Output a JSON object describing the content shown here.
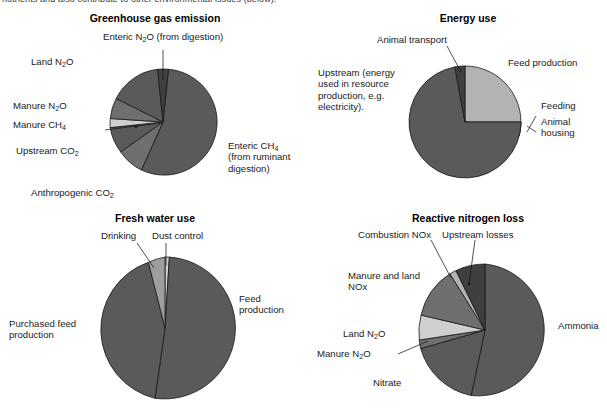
{
  "page": {
    "cropped_caption": "nutrients and also contribute to other environmental issues (below)."
  },
  "colors": {
    "dark_main": "#5a5a5a",
    "dark_deep": "#3f3f3f",
    "mid": "#6f6f6f",
    "light": "#b3b3b3",
    "pale": "#cfcfcf",
    "outline": "#15181a",
    "text": "#1a1a1a",
    "background": "#ffffff"
  },
  "charts": [
    {
      "id": "greenhouse-gas-emission",
      "title": "Greenhouse gas emission",
      "labels": [
        "Enteric N₂O (from digestion)",
        "Land N₂O",
        "Manure N₂O",
        "Manure CH₄",
        "Upstream CO₂",
        "Anthropogenic CO₂",
        "Enteric CH₄ (from ruminant digestion)"
      ]
    },
    {
      "id": "energy-use",
      "title": "Energy use",
      "labels": [
        "Animal transport",
        "Feed production",
        "Feeding",
        "Animal housing",
        "Upstream (energy used in resource production, e.g. electricity)."
      ]
    },
    {
      "id": "fresh-water-use",
      "title": "Fresh water use",
      "labels": [
        "Drinking",
        "Dust control",
        "Feed production",
        "Purchased feed production"
      ]
    },
    {
      "id": "reactive-nitrogen-loss",
      "title": "Reactive nitrogen loss",
      "labels": [
        "Combustion NOx",
        "Upstream losses",
        "Manure and land NOx",
        "Land N₂O",
        "Manure N₂O",
        "Nitrate",
        "Ammonia"
      ]
    }
  ],
  "chart_data": [
    {
      "type": "pie",
      "id": "greenhouse-gas-emission",
      "title": "Greenhouse gas emission",
      "legend": "labels-with-leader-lines",
      "start_angle_deg": -90,
      "direction": "clockwise",
      "categories": [
        "Enteric CH₄ (from ruminant digestion)",
        "Anthropogenic CO₂",
        "Upstream CO₂",
        "Manure CH₄",
        "Manure N₂O",
        "Land N₂O",
        "Enteric N₂O (from digestion)"
      ],
      "values": [
        55,
        8,
        17,
        4,
        5,
        8,
        3
      ],
      "units": "percent",
      "slice_colors": [
        "#5a5a5a",
        "#6f6f6f",
        "#5a5a5a",
        "#cfcfcf",
        "#6f6f6f",
        "#5a5a5a",
        "#3f3f3f"
      ]
    },
    {
      "type": "pie",
      "id": "energy-use",
      "title": "Energy use",
      "legend": "labels-with-leader-lines",
      "start_angle_deg": -90,
      "direction": "clockwise",
      "categories": [
        "Feed production",
        "Feeding",
        "Animal housing",
        "Upstream (energy used in resource production, e.g. electricity).",
        "Animal transport"
      ],
      "values": [
        21,
        3,
        2,
        71,
        3
      ],
      "units": "percent",
      "slice_colors": [
        "#b3b3b3",
        "#4a4a4a",
        "#cfcfcf",
        "#5a5a5a",
        "#3f3f3f"
      ]
    },
    {
      "type": "pie",
      "id": "fresh-water-use",
      "title": "Fresh water use",
      "legend": "labels-with-leader-lines",
      "start_angle_deg": -90,
      "direction": "clockwise",
      "categories": [
        "Dust control",
        "Feed production",
        "Purchased feed production",
        "Drinking"
      ],
      "values": [
        1,
        49,
        46,
        4
      ],
      "units": "percent",
      "slice_colors": [
        "#cfcfcf",
        "#5a5a5a",
        "#5a5a5a",
        "#9e9e9e"
      ]
    },
    {
      "type": "pie",
      "id": "reactive-nitrogen-loss",
      "title": "Reactive nitrogen loss",
      "legend": "labels-with-leader-lines",
      "start_angle_deg": -90,
      "direction": "clockwise",
      "categories": [
        "Ammonia",
        "Nitrate",
        "Manure N₂O",
        "Land N₂O",
        "Manure and land NOx",
        "Combustion NOx",
        "Upstream losses"
      ],
      "values": [
        45,
        20,
        3,
        8,
        14,
        2,
        8
      ],
      "units": "percent",
      "slice_colors": [
        "#5a5a5a",
        "#5a5a5a",
        "#6f6f6f",
        "#cfcfcf",
        "#6f6f6f",
        "#b3b3b3",
        "#3f3f3f"
      ]
    }
  ]
}
